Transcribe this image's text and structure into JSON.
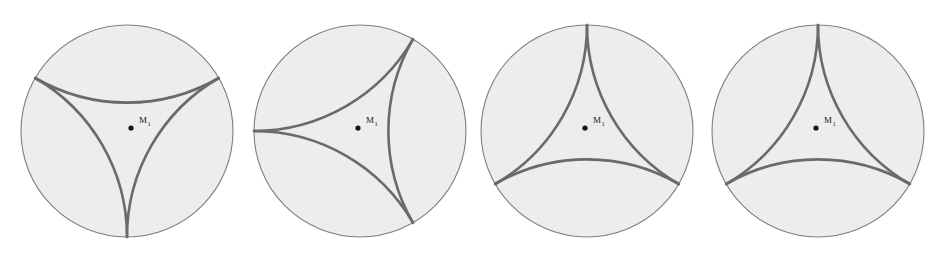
{
  "figure": {
    "caption": "",
    "background_color": "#ffffff",
    "width": 950,
    "height": 254,
    "disk_count": 4
  },
  "style": {
    "disk_fill": "#efefef",
    "disk_stroke": "#7b7b7b",
    "disk_stroke_width": 1.1,
    "geodesic_stroke": "#6a6a6a",
    "geodesic_stroke_width": 2.6,
    "center_dot_fill": "#141414",
    "center_dot_radius": 2.6,
    "label_color": "#1a1a1a"
  },
  "disks": [
    {
      "id": "disk-1",
      "index": 1,
      "cx": 127,
      "cy": 131,
      "r": 106,
      "rotation_deg": 270,
      "ideal_vertex_angles_deg": [
        270,
        30,
        150
      ],
      "label": {
        "text": "M",
        "subscript": "1",
        "x": 139,
        "y": 123
      },
      "center_point": {
        "x": 131,
        "y": 128
      }
    },
    {
      "id": "disk-2",
      "index": 2,
      "cx": 360,
      "cy": 131,
      "r": 106,
      "rotation_deg": 300,
      "ideal_vertex_angles_deg": [
        300,
        60,
        180
      ],
      "label": {
        "text": "M",
        "subscript": "1",
        "x": 366,
        "y": 123
      },
      "center_point": {
        "x": 358,
        "y": 128
      }
    },
    {
      "id": "disk-3",
      "index": 3,
      "cx": 587,
      "cy": 131,
      "r": 106,
      "rotation_deg": 330,
      "ideal_vertex_angles_deg": [
        330,
        90,
        210
      ],
      "label": {
        "text": "M",
        "subscript": "1",
        "x": 593,
        "y": 123
      },
      "center_point": {
        "x": 585,
        "y": 128
      }
    },
    {
      "id": "disk-4",
      "index": 4,
      "cx": 818,
      "cy": 131,
      "r": 106,
      "rotation_deg": 0,
      "ideal_vertex_angles_deg": [
        90,
        210,
        330
      ],
      "label": {
        "text": "M",
        "subscript": "1",
        "x": 824,
        "y": 123
      },
      "center_point": {
        "x": 816,
        "y": 128
      }
    }
  ]
}
